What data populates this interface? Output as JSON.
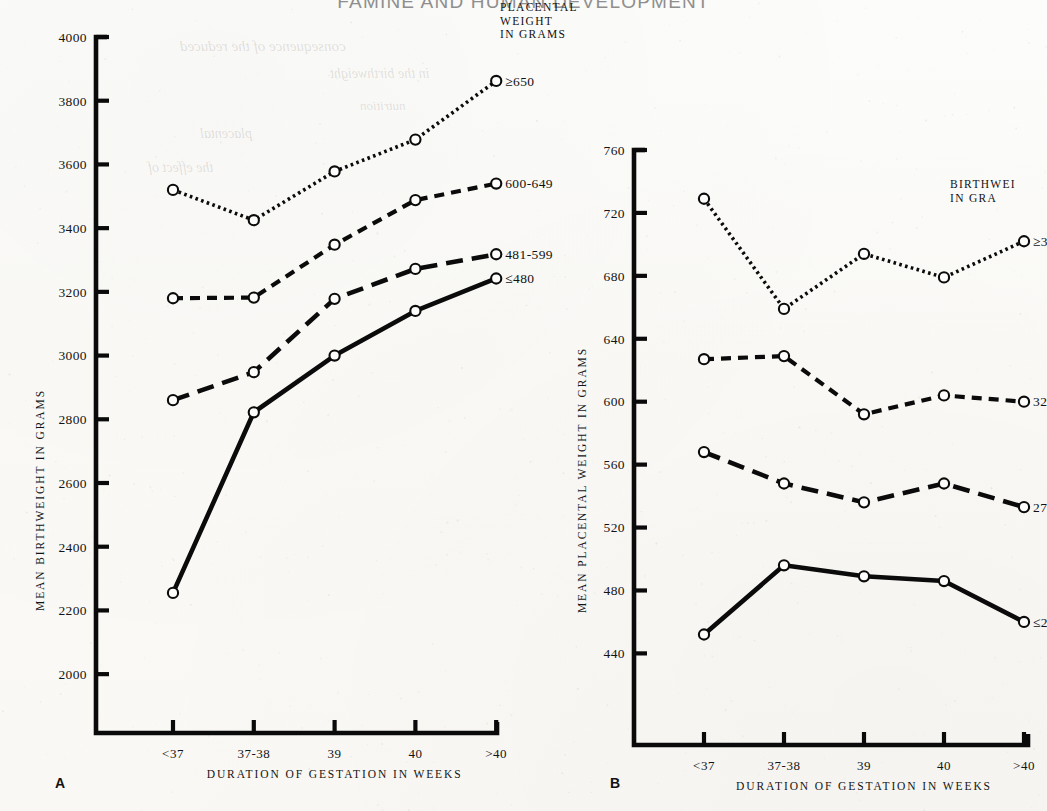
{
  "running_head": "FAMINE AND HUMAN DEVELOPMENT",
  "panels": [
    {
      "letter": "A",
      "chart_data": {
        "type": "line",
        "title": "",
        "xlabel": "DURATION OF GESTATION IN WEEKS",
        "ylabel": "MEAN BIRTHWEIGHT IN GRAMS",
        "categories": [
          "<37",
          "37-38",
          "39",
          "40",
          ">40"
        ],
        "ylim": [
          1900,
          4000
        ],
        "yticks": [
          2000,
          2200,
          2400,
          2600,
          2800,
          3000,
          3200,
          3400,
          3600,
          3800,
          4000
        ],
        "grid": false,
        "legend_title": [
          "PLACENTAL",
          "WEIGHT",
          "IN GRAMS"
        ],
        "legend_position": "right-of-line-ends",
        "series": [
          {
            "name": "≥650",
            "style": "dotted",
            "values": [
              3520,
              3425,
              3578,
              3678,
              3862
            ]
          },
          {
            "name": "600-649",
            "style": "dashed",
            "values": [
              3180,
              3182,
              3348,
              3488,
              3540
            ]
          },
          {
            "name": "481-599",
            "style": "long-dashed",
            "values": [
              2860,
              2948,
              3178,
              3272,
              3318
            ]
          },
          {
            "name": "≤480",
            "style": "solid",
            "values": [
              2255,
              2822,
              3000,
              3140,
              3242
            ]
          }
        ]
      }
    },
    {
      "letter": "B",
      "chart_data": {
        "type": "line",
        "title": "",
        "xlabel": "DURATION OF GESTATION IN WEEKS",
        "ylabel": "MEAN PLACENTAL WEIGHT IN GRAMS",
        "categories": [
          "<37",
          "37-38",
          "39",
          "40",
          ">40"
        ],
        "ylim": [
          418,
          760
        ],
        "yticks": [
          440,
          480,
          520,
          560,
          600,
          640,
          680,
          720,
          760
        ],
        "grid": false,
        "legend_title": [
          "BIRTHWEI",
          "IN GRA"
        ],
        "legend_position": "right-of-line-ends",
        "series": [
          {
            "name": "≥3660",
            "style": "dotted",
            "values": [
              729,
              659,
              694,
              679,
              702
            ]
          },
          {
            "name": "3290-3",
            "style": "dashed",
            "values": [
              627,
              629,
              592,
              604,
              600
            ]
          },
          {
            "name": "2781-3",
            "style": "long-dashed",
            "values": [
              568,
              548,
              536,
              548,
              533
            ]
          },
          {
            "name": "≤2780",
            "style": "solid",
            "values": [
              452,
              496,
              489,
              486,
              460
            ]
          }
        ]
      }
    }
  ],
  "ghost_text": [
    "consequence of the reduced",
    "in the birthweight",
    "placental",
    "the effect of",
    "nutrition"
  ]
}
